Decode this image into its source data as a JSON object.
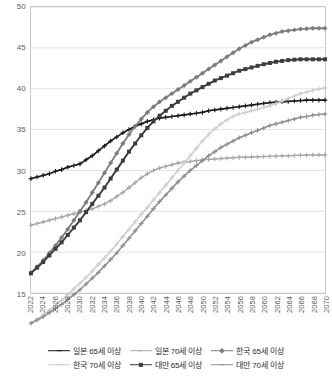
{
  "chart_data": {
    "type": "line",
    "title": "",
    "xlabel": "",
    "ylabel": "",
    "ylim": [
      15,
      50
    ],
    "ytick_step": 5,
    "yticks": [
      "15",
      "20",
      "25",
      "30",
      "35",
      "40",
      "45",
      "50"
    ],
    "grid": true,
    "legend_position": "bottom",
    "xlim": [
      2022,
      2070
    ],
    "x": [
      2022,
      2023,
      2024,
      2025,
      2026,
      2027,
      2028,
      2029,
      2030,
      2031,
      2032,
      2033,
      2034,
      2035,
      2036,
      2037,
      2038,
      2039,
      2040,
      2041,
      2042,
      2043,
      2044,
      2045,
      2046,
      2047,
      2048,
      2049,
      2050,
      2051,
      2052,
      2053,
      2054,
      2055,
      2056,
      2057,
      2058,
      2059,
      2060,
      2061,
      2062,
      2063,
      2064,
      2065,
      2066,
      2067,
      2068,
      2069,
      2070
    ],
    "xticks": [
      "2022",
      "2024",
      "2026",
      "2028",
      "2030",
      "2032",
      "2034",
      "2036",
      "2038",
      "2040",
      "2042",
      "2044",
      "2046",
      "2048",
      "2050",
      "2052",
      "2054",
      "2056",
      "2058",
      "2060",
      "2062",
      "2064",
      "2066",
      "2068",
      "2070"
    ],
    "series": [
      {
        "name": "일본 65세 이상",
        "color": "#1c1c1c",
        "marker": "plus",
        "width": 1.7,
        "values": [
          29.0,
          29.2,
          29.4,
          29.6,
          29.9,
          30.1,
          30.4,
          30.6,
          30.8,
          31.3,
          31.8,
          32.4,
          33.0,
          33.6,
          34.1,
          34.6,
          35.0,
          35.4,
          35.7,
          36.0,
          36.2,
          36.4,
          36.5,
          36.6,
          36.7,
          36.8,
          36.9,
          37.0,
          37.1,
          37.3,
          37.4,
          37.5,
          37.6,
          37.7,
          37.8,
          37.9,
          38.0,
          38.1,
          38.2,
          38.3,
          38.35,
          38.4,
          38.45,
          38.5,
          38.55,
          38.6,
          38.6,
          38.6,
          38.6
        ]
      },
      {
        "name": "일본 70세 이상",
        "color": "#a8a8a8",
        "marker": "plus",
        "width": 1.5,
        "values": [
          23.3,
          23.5,
          23.7,
          23.9,
          24.1,
          24.3,
          24.5,
          24.7,
          24.9,
          25.1,
          25.3,
          25.6,
          25.9,
          26.3,
          26.8,
          27.3,
          27.9,
          28.5,
          29.1,
          29.6,
          30.0,
          30.3,
          30.5,
          30.7,
          30.9,
          31.0,
          31.1,
          31.2,
          31.3,
          31.35,
          31.4,
          31.45,
          31.5,
          31.55,
          31.6,
          31.62,
          31.65,
          31.68,
          31.7,
          31.72,
          31.75,
          31.78,
          31.8,
          31.82,
          31.85,
          31.87,
          31.88,
          31.89,
          31.9
        ]
      },
      {
        "name": "한국 65세 이상",
        "color": "#7d7d7d",
        "marker": "diamond",
        "width": 1.8,
        "values": [
          17.5,
          18.2,
          19.0,
          19.9,
          20.8,
          21.8,
          22.8,
          23.9,
          25.0,
          26.1,
          27.3,
          28.5,
          29.7,
          30.9,
          32.1,
          33.3,
          34.4,
          35.4,
          36.3,
          37.1,
          37.8,
          38.4,
          38.9,
          39.4,
          39.9,
          40.4,
          40.9,
          41.4,
          41.9,
          42.4,
          42.9,
          43.4,
          43.9,
          44.4,
          44.9,
          45.3,
          45.7,
          46.0,
          46.3,
          46.6,
          46.8,
          47.0,
          47.1,
          47.2,
          47.3,
          47.35,
          47.4,
          47.4,
          47.4
        ]
      },
      {
        "name": "한국 70세 이상",
        "color": "#cfcfcf",
        "marker": "plus",
        "width": 1.6,
        "values": [
          11.3,
          11.8,
          12.3,
          12.9,
          13.5,
          14.1,
          14.8,
          15.5,
          16.2,
          16.9,
          17.7,
          18.5,
          19.3,
          20.1,
          21.0,
          21.9,
          22.8,
          23.7,
          24.6,
          25.5,
          26.4,
          27.3,
          28.2,
          29.1,
          30.0,
          30.9,
          31.8,
          32.7,
          33.6,
          34.4,
          35.1,
          35.7,
          36.2,
          36.6,
          36.9,
          37.1,
          37.3,
          37.5,
          37.7,
          37.9,
          38.2,
          38.5,
          38.8,
          39.1,
          39.4,
          39.6,
          39.8,
          39.95,
          40.1
        ]
      },
      {
        "name": "대만 65세 이상",
        "color": "#3d3d3d",
        "marker": "square",
        "width": 1.9,
        "values": [
          17.4,
          18.1,
          18.8,
          19.6,
          20.4,
          21.2,
          22.1,
          23.0,
          23.9,
          24.9,
          25.9,
          26.9,
          27.9,
          29.0,
          30.1,
          31.2,
          32.3,
          33.3,
          34.3,
          35.2,
          36.0,
          36.7,
          37.3,
          37.9,
          38.4,
          38.9,
          39.4,
          39.8,
          40.2,
          40.6,
          41.0,
          41.3,
          41.6,
          41.9,
          42.2,
          42.4,
          42.6,
          42.8,
          43.0,
          43.15,
          43.3,
          43.4,
          43.5,
          43.55,
          43.6,
          43.6,
          43.6,
          43.6,
          43.6
        ]
      },
      {
        "name": "대만 70세 이상",
        "color": "#8f8f8f",
        "marker": "plus",
        "width": 1.6,
        "values": [
          11.3,
          11.7,
          12.1,
          12.6,
          13.1,
          13.6,
          14.2,
          14.8,
          15.4,
          16.1,
          16.8,
          17.5,
          18.3,
          19.1,
          19.9,
          20.8,
          21.7,
          22.6,
          23.5,
          24.4,
          25.3,
          26.2,
          27.0,
          27.8,
          28.6,
          29.3,
          30.0,
          30.6,
          31.2,
          31.8,
          32.3,
          32.8,
          33.2,
          33.6,
          34.0,
          34.3,
          34.6,
          34.9,
          35.2,
          35.5,
          35.7,
          35.9,
          36.1,
          36.3,
          36.5,
          36.6,
          36.75,
          36.85,
          36.9
        ]
      }
    ]
  },
  "legend": {
    "rows": [
      [
        {
          "label": "일본 65세 이상",
          "series_index": 0
        },
        {
          "label": "일본 70세 이상",
          "series_index": 1
        },
        {
          "label": "한국 65세 이상",
          "series_index": 2
        }
      ],
      [
        {
          "label": "한국 70세 이상",
          "series_index": 3
        },
        {
          "label": "대만 65세 이상",
          "series_index": 4
        },
        {
          "label": "대만 70세 이상",
          "series_index": 5
        }
      ]
    ]
  },
  "style": {
    "grid_color": "#dcdcdc",
    "border_color": "#c9c9c9",
    "tick_color": "#5d5d5d",
    "background": "#ffffff"
  }
}
